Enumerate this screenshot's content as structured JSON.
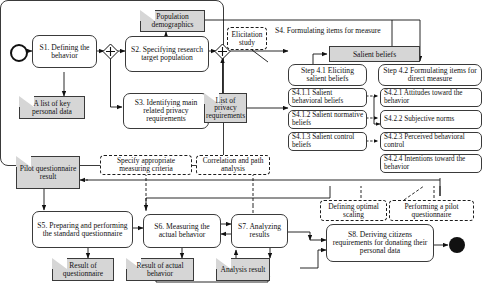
{
  "diagram": {
    "start_marker": "start-circle",
    "end_marker": "end-circle"
  },
  "nodes": {
    "s1": "S1. Defining the behavior",
    "s2": "S2. Specifying research target population",
    "s3": "S3. Identifying main related privacy requirements",
    "s5": "S5. Preparing and performing the standard questionnaire",
    "s6": "S6. Measuring the actual behavior",
    "s7": "S7. Analyzing results",
    "s8": "S8. Deriving citizens requirements for donating their personal data",
    "s4_title": "S4. Formulating items for measure",
    "step41": "Step 4.1 Eliciting salient beliefs",
    "step42": "Step 4.2 Formulating items for direct measure",
    "s411": "S4.1.1 Salient behavioral beliefs",
    "s412": "S4.1.2 Salient normative beliefs",
    "s413": "S4.1.3 Salient control beliefs",
    "s421": "S4.2.1  Attitudes toward the behavior",
    "s422": "S4.2.2 Subjective norms",
    "s423": "S4.2.3 Perceived behavioral control",
    "s424": "S4.2.4 Intentions toward the behavior"
  },
  "documents": {
    "population_demographics": "Population demographics",
    "list_of_key_personal_data": "A list of key personal data",
    "list_of_privacy_requirements": "List of privacy requirements",
    "pilot_questionnaire_result": "Pilot questionnaire result",
    "result_of_questionnaire": "Result of questionnaire",
    "result_of_actual_behavior": "Result of actual behavior",
    "analysis_result": "Analysis result",
    "salient_beliefs": "Salient beliefs"
  },
  "notes": {
    "elicitation_study": "Elicitation study",
    "specify_criteria": "Specify appropriate measuring criteria",
    "correlation_path": "Correlation and path analysis",
    "defining_optimal_scaling": "Defining optimal scaling",
    "performing_pilot": "Performing a pilot questionnaire"
  },
  "colors": {
    "document_fill": "#d6d6d6",
    "stroke": "#3a3a3a",
    "text": "#111111",
    "background": "#ffffff"
  }
}
